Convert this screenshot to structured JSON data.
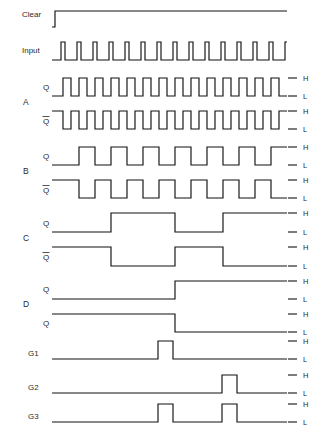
{
  "figure": {
    "kind": "digital-timing-diagram",
    "title": "",
    "background_color": "#ffffff",
    "line_color": "#111111",
    "width": 327,
    "height": 440
  },
  "labels": {
    "clear": "Clear",
    "input": "Input",
    "q": "Q",
    "qbar": "Q",
    "group_a": "A",
    "group_b": "B",
    "group_c": "C",
    "group_d": "D",
    "g1": "G1",
    "g2": "G2",
    "g3": "G3",
    "high": "H",
    "low": "L"
  },
  "chart_data": {
    "type": "line",
    "xlabel": "",
    "ylabel": "",
    "xlim": [
      52,
      287
    ],
    "level_values": [
      "L",
      "H"
    ],
    "axis_tick_labels": [
      "H",
      "L"
    ],
    "grid": false,
    "legend_position": "none",
    "time_axis": {
      "start_px": 52,
      "end_px": 287,
      "clock_period_px": 16,
      "first_edge_px": 63,
      "cycles": 15
    },
    "series": [
      {
        "name": "Clear",
        "group": "",
        "row": 0,
        "y_top": 11,
        "y_bottom": 27,
        "start_level": "L",
        "has_hl_labels": false,
        "transitions_px": [
          52,
          55
        ],
        "description": "single narrow active pulse at the start of the sequence",
        "segments": [
          {
            "from": 52,
            "to": 52,
            "level": "L"
          },
          {
            "from": 52,
            "to": 55,
            "level": "H"
          },
          {
            "from": 55,
            "to": 287,
            "level": "L"
          }
        ]
      },
      {
        "name": "Input",
        "group": "",
        "row": 1,
        "y_top": 42,
        "y_bottom": 60,
        "start_level": "L",
        "has_hl_labels": false,
        "description": "15 narrow clock pulses, period 16 px, pulse width 4 px",
        "pulse_period_px": 16,
        "pulse_width_px": 4,
        "pulse_count": 15,
        "first_pulse_start_px": 61
      },
      {
        "name": "Q",
        "group": "A",
        "row": 2,
        "y_top": 78,
        "y_bottom": 96,
        "start_level": "L",
        "has_hl_labels": true,
        "divide_by": 2,
        "period_px": 16,
        "first_rise_px": 63,
        "description": "divide-by-2 square wave, toggles on each input pulse"
      },
      {
        "name": "Qbar",
        "group": "A",
        "row": 3,
        "y_top": 111,
        "y_bottom": 129,
        "start_level": "H",
        "has_hl_labels": true,
        "divide_by": 2,
        "period_px": 16,
        "first_fall_px": 63,
        "description": "complement of A Q"
      },
      {
        "name": "Q",
        "group": "B",
        "row": 4,
        "y_top": 147,
        "y_bottom": 165,
        "start_level": "L",
        "has_hl_labels": true,
        "divide_by": 4,
        "period_px": 32,
        "first_rise_px": 79,
        "description": "divide-by-4 square wave"
      },
      {
        "name": "Qbar",
        "group": "B",
        "row": 5,
        "y_top": 180,
        "y_bottom": 198,
        "start_level": "H",
        "has_hl_labels": true,
        "divide_by": 4,
        "period_px": 32,
        "first_fall_px": 79,
        "description": "complement of B Q"
      },
      {
        "name": "Q",
        "group": "C",
        "row": 6,
        "y_top": 213,
        "y_bottom": 232,
        "start_level": "L",
        "has_hl_labels": true,
        "divide_by": 8,
        "period_px": 64,
        "first_rise_px": 111,
        "description": "divide-by-8 square wave",
        "transitions_px": [
          111,
          175,
          223
        ]
      },
      {
        "name": "Qbar",
        "group": "C",
        "row": 7,
        "y_top": 247,
        "y_bottom": 266,
        "start_level": "H",
        "has_hl_labels": true,
        "divide_by": 8,
        "period_px": 64,
        "first_fall_px": 111,
        "description": "complement of C Q",
        "transitions_px": [
          111,
          175,
          223
        ]
      },
      {
        "name": "Q",
        "group": "D",
        "row": 8,
        "y_top": 281,
        "y_bottom": 299,
        "start_level": "L",
        "has_hl_labels": true,
        "divide_by": 16,
        "transitions_px": [
          175
        ],
        "description": "single low-to-high transition, divide-by-16"
      },
      {
        "name": "Qbar",
        "group": "D",
        "row": 9,
        "y_top": 314,
        "y_bottom": 332,
        "start_level": "H",
        "has_hl_labels": true,
        "divide_by": 16,
        "transitions_px": [
          175
        ],
        "description": "single high-to-low transition, complement of D Q"
      },
      {
        "name": "G1",
        "group": "",
        "row": 10,
        "y_top": 341,
        "y_bottom": 359,
        "start_level": "L",
        "has_hl_labels": true,
        "description": "one decode pulse",
        "pulses_px": [
          [
            158,
            173
          ]
        ]
      },
      {
        "name": "G2",
        "group": "",
        "row": 11,
        "y_top": 375,
        "y_bottom": 393,
        "start_level": "L",
        "has_hl_labels": true,
        "description": "one decode pulse, later in the sequence",
        "pulses_px": [
          [
            222,
            237
          ]
        ]
      },
      {
        "name": "G3",
        "group": "",
        "row": 12,
        "y_top": 404,
        "y_bottom": 422,
        "start_level": "L",
        "has_hl_labels": true,
        "description": "two decode pulses coinciding with G1 and G2",
        "pulses_px": [
          [
            158,
            173
          ],
          [
            222,
            237
          ]
        ]
      }
    ]
  }
}
